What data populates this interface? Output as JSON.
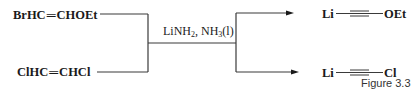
{
  "diagram": {
    "reactants": [
      {
        "label_left": "BrHC",
        "bond": "═",
        "label_right": "CHOEt",
        "full": "BrHC═CHOEt"
      },
      {
        "label_left": "ClHC",
        "bond": "═",
        "label_right": "CHCl",
        "full": "ClHC═CHCl"
      }
    ],
    "reagent": {
      "part1": "LiNH",
      "sub1": "2",
      "part2": ", NH",
      "sub2": "3",
      "part3": "(l)",
      "full": "LiNH2, NH3(l)"
    },
    "products": [
      {
        "left": "Li",
        "bond": "triple",
        "right": "OEt",
        "full": "Li—C≡C—OEt"
      },
      {
        "left": "Li",
        "bond": "triple",
        "right": "Cl",
        "full": "Li—C≡C—Cl"
      }
    ],
    "caption": "Figure 3.3",
    "colors": {
      "ink": "#1a1a1a",
      "line": "#3a3a3a",
      "background": "#ffffff"
    }
  }
}
